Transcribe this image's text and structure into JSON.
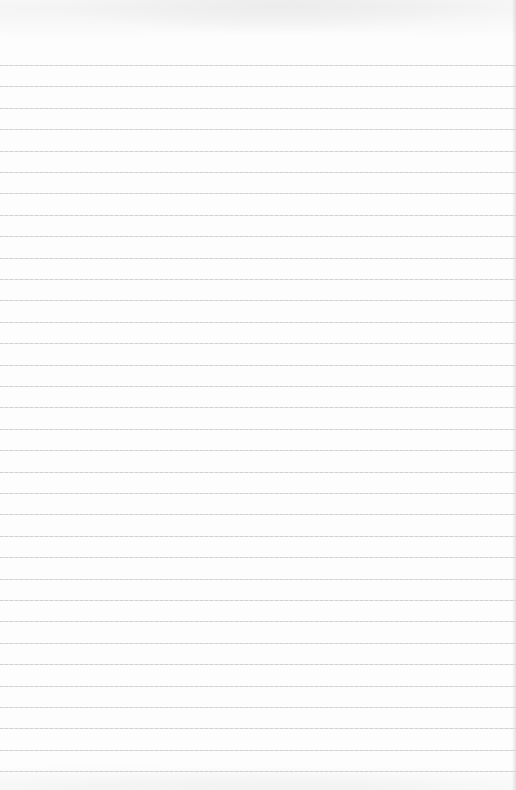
{
  "page": {
    "type": "lined-paper",
    "background_color": "#fdfdfd",
    "line_color": "#c9c9c9",
    "first_line_y": 65,
    "line_spacing": 21.4,
    "line_count": 34
  }
}
